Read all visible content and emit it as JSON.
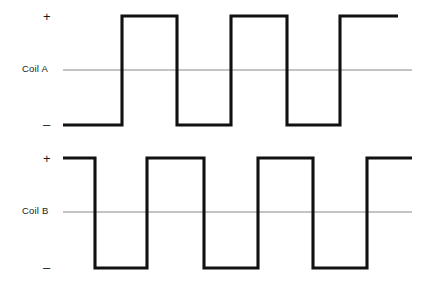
{
  "figure": {
    "width": 431,
    "height": 285,
    "background_color": "#ffffff",
    "trace_color": "#111111",
    "axis_color": "#888888",
    "text_color": "#1a1a1a"
  },
  "labels": {
    "coil_a": "Coil A",
    "coil_b": "Coil B",
    "plus": "+",
    "minus": "–"
  },
  "chart_data": {
    "type": "line",
    "xlabel": "",
    "ylabel": "",
    "grid": false,
    "legend_position": "left-axis-labels",
    "y_levels": {
      "plus": 1,
      "zero": 0,
      "minus": -1
    },
    "series": [
      {
        "name": "Coil A",
        "label": "Coil A",
        "waveform": "square",
        "start_level": -1,
        "transitions_px": [
          63,
          122,
          177,
          231,
          287,
          340,
          398
        ],
        "levels": [
          -1,
          1,
          -1,
          1,
          -1,
          1
        ],
        "y_top_px": 16,
        "y_zero_px": 70,
        "y_bottom_px": 125,
        "zero_line_start_px": 63,
        "zero_line_end_px": 412
      },
      {
        "name": "Coil B",
        "label": "Coil B",
        "waveform": "square",
        "start_level": 1,
        "transitions_px": [
          63,
          95,
          147,
          204,
          258,
          313,
          367,
          412
        ],
        "levels": [
          1,
          -1,
          1,
          -1,
          1,
          -1,
          1
        ],
        "y_top_px": 158,
        "y_zero_px": 212,
        "y_bottom_px": 268,
        "zero_line_start_px": 63,
        "zero_line_end_px": 412
      }
    ],
    "annotations": [
      {
        "text": "+",
        "series": "Coil A",
        "position": "top-left"
      },
      {
        "text": "–",
        "series": "Coil A",
        "position": "bottom-left"
      },
      {
        "text": "+",
        "series": "Coil B",
        "position": "top-left"
      },
      {
        "text": "–",
        "series": "Coil B",
        "position": "bottom-left"
      }
    ]
  }
}
